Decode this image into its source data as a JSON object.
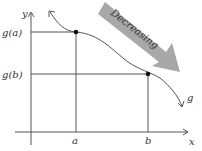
{
  "diagram": {
    "axes": {
      "x_label": "x",
      "y_label": "y"
    },
    "y_ticks": [
      "g(a)",
      "g(b)"
    ],
    "x_ticks": [
      "a",
      "b"
    ],
    "curve_label": "g",
    "arrow_label": "Decreasing",
    "colors": {
      "axis": "#555555",
      "curve": "#555555",
      "arrow": "#a8a8a8",
      "point": "#111111"
    }
  }
}
